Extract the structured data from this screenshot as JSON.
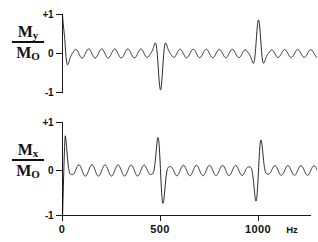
{
  "figure": {
    "background": "#ffffff",
    "ink_color": "#000000"
  },
  "panels": [
    {
      "id": "my",
      "axis_title_numerator": "M",
      "axis_title_numerator_sub": "y",
      "axis_title_denominator": "M",
      "axis_title_denominator_sub": "O",
      "y_ticks": [
        "+1",
        "0",
        "-1"
      ]
    },
    {
      "id": "mx",
      "axis_title_numerator": "M",
      "axis_title_numerator_sub": "x",
      "axis_title_denominator": "M",
      "axis_title_denominator_sub": "O",
      "y_ticks": [
        "+1",
        "0",
        "-1"
      ]
    }
  ],
  "x_axis": {
    "ticks": [
      "0",
      "500",
      "1000"
    ],
    "tick_values": [
      0,
      500,
      1000
    ],
    "unit": "Hz",
    "min": 0,
    "max": 1310
  },
  "chart_data": {
    "type": "line",
    "title": "",
    "xlabel": "Hz",
    "ylabel": "",
    "xlim": [
      0,
      1310
    ],
    "ylim": [
      -1,
      1
    ],
    "grid": false,
    "legend": null,
    "echo_period_hz": 500,
    "echo_positions_hz": [
      0,
      500,
      1000
    ],
    "carrier_frequency_hz": 15,
    "series": [
      {
        "name": "My/M0",
        "ylabel_numerator": "My",
        "ylabel_denominator": "M0",
        "yticks": [
          1,
          0,
          -1
        ],
        "initial_value": 1.0,
        "echo_peak_values": [
          1.0,
          0.93,
          0.9
        ],
        "baseline_ripple_amplitude": 0.12,
        "description": "Cosine-type magnetization starting at +1, decaying into ripple, with rephasing echoes near +1 at 500 and 1000 Hz"
      },
      {
        "name": "Mx/M0",
        "ylabel_numerator": "Mx",
        "ylabel_denominator": "M0",
        "yticks": [
          1,
          0,
          -1
        ],
        "initial_value": -1.0,
        "echo_peak_values": [
          -1.0,
          0.9,
          0.9
        ],
        "echo_trough_values": [
          -1.0,
          -0.93,
          -0.9
        ],
        "baseline_ripple_amplitude": 0.12,
        "description": "Sine-type magnetization starting with a downward spike to -1, ripple baseline, antisymmetric echoes at 500 and 1000 Hz"
      }
    ]
  }
}
